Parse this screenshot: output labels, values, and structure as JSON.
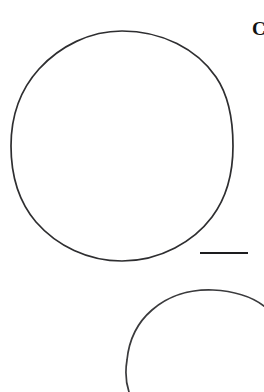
{
  "figure": {
    "panel_label": "C",
    "background_color": "#ffffff",
    "stroke_color": "#2e2e30",
    "canvas_width": 264,
    "canvas_height": 392
  },
  "shapes": {
    "primary_outline": {
      "name": "large-cell-outline",
      "kind": "closed-contour",
      "center_x": 122,
      "center_y": 146,
      "radius_x": 111,
      "radius_y": 115,
      "stroke_width": 1.7,
      "stroke_color": "#2e2e30"
    },
    "secondary_outline": {
      "name": "partial-cell-outline",
      "kind": "cropped-contour",
      "center_x": 213,
      "center_y": 393,
      "radius_x": 87,
      "radius_y": 103,
      "stroke_width": 1.7,
      "stroke_color": "#3a3a3c"
    },
    "scale_bar": {
      "name": "scale-bar",
      "x1": 200,
      "y1": 253,
      "x2": 248,
      "y2": 253,
      "stroke_width": 2.1,
      "stroke_color": "#1d1d1f",
      "length_px": 48
    }
  }
}
